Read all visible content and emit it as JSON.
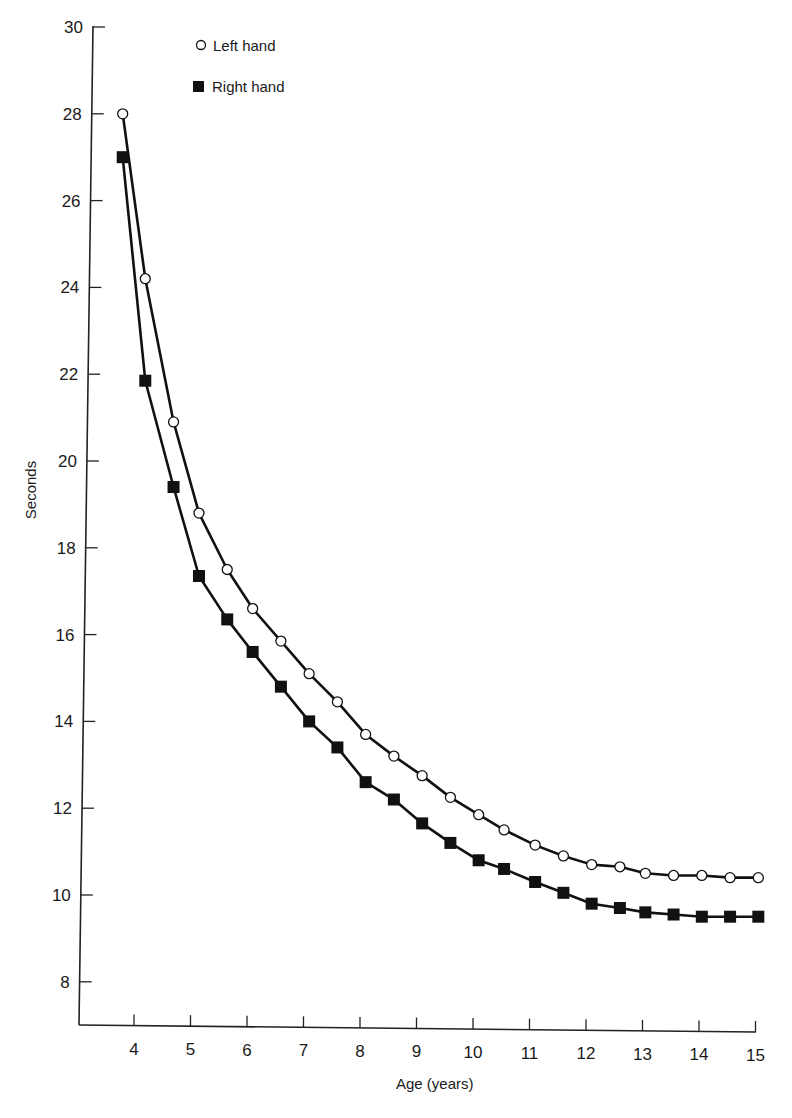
{
  "chart_data": {
    "type": "line",
    "title": "",
    "xlabel": "Age (years)",
    "ylabel": "Seconds",
    "xlim": [
      3.2,
      15
    ],
    "ylim": [
      7,
      30
    ],
    "x_ticks": [
      4,
      5,
      6,
      7,
      8,
      9,
      10,
      11,
      12,
      13,
      14,
      15
    ],
    "y_ticks": [
      8,
      10,
      12,
      14,
      16,
      18,
      20,
      22,
      24,
      26,
      28,
      30
    ],
    "grid": false,
    "legend_position": "top-left inside",
    "x": [
      3.8,
      4.2,
      4.7,
      5.15,
      5.65,
      6.1,
      6.6,
      7.1,
      7.6,
      8.1,
      8.6,
      9.1,
      9.6,
      10.1,
      10.55,
      11.1,
      11.6,
      12.1,
      12.6,
      13.05,
      13.55,
      14.05,
      14.55,
      15.05
    ],
    "series": [
      {
        "name": "Left hand",
        "marker": "open-circle",
        "values": [
          28.0,
          24.2,
          20.9,
          18.8,
          17.5,
          16.6,
          15.85,
          15.1,
          14.45,
          13.7,
          13.2,
          12.75,
          12.25,
          11.85,
          11.5,
          11.15,
          10.9,
          10.7,
          10.65,
          10.5,
          10.45,
          10.45,
          10.4,
          10.4
        ]
      },
      {
        "name": "Right hand",
        "marker": "filled-square",
        "values": [
          27.0,
          21.85,
          19.4,
          17.35,
          16.35,
          15.6,
          14.8,
          14.0,
          13.4,
          12.6,
          12.2,
          11.65,
          11.2,
          10.8,
          10.6,
          10.3,
          10.05,
          9.8,
          9.7,
          9.6,
          9.55,
          9.5,
          9.5,
          9.5
        ]
      }
    ]
  },
  "legend": {
    "items": [
      {
        "label": "Left hand",
        "marker": "open-circle"
      },
      {
        "label": "Right hand",
        "marker": "filled-square"
      }
    ]
  },
  "colors": {
    "line": "#111111",
    "axis": "#222222",
    "background": "#ffffff"
  }
}
